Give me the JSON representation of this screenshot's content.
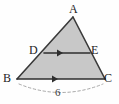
{
  "figure": {
    "kind": "geometry-diagram",
    "background_color": "#fefefe",
    "fill_color": "#c8c8c8",
    "stroke_color": "#333333",
    "dash_color": "#a8a8a8",
    "labels": {
      "apex": "A",
      "bottom_left": "B",
      "bottom_right": "C",
      "mid_left": "D",
      "mid_right": "E",
      "base_measure": "6"
    },
    "points": {
      "A": {
        "x": 73,
        "y": 17
      },
      "B": {
        "x": 17,
        "y": 79
      },
      "C": {
        "x": 105,
        "y": 79
      },
      "D": {
        "x": 44,
        "y": 53
      },
      "E": {
        "x": 90,
        "y": 53
      }
    },
    "segments": [
      {
        "name": "side-AB",
        "from": "A",
        "to": "B",
        "style": "solid"
      },
      {
        "name": "side-AC",
        "from": "A",
        "to": "C",
        "style": "solid"
      },
      {
        "name": "base-BC",
        "from": "B",
        "to": "C",
        "style": "solid",
        "arrow": "single-right"
      },
      {
        "name": "midsegment-DE",
        "from": "D",
        "to": "E",
        "style": "solid",
        "arrow": "single-right"
      }
    ],
    "annotations": [
      {
        "name": "base-measure-arc",
        "style": "dashed-arc",
        "spans": "B to C",
        "value": "6"
      }
    ]
  }
}
